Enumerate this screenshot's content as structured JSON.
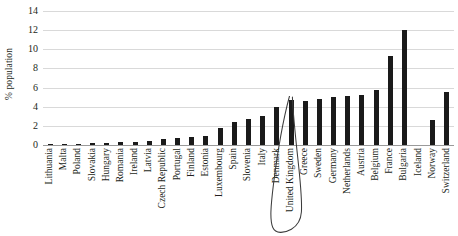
{
  "chart_data": {
    "type": "bar",
    "title": "",
    "xlabel": "",
    "ylabel": "% population",
    "ylim": [
      0,
      14
    ],
    "ytick_step": 2,
    "yticks": [
      14,
      12,
      10,
      8,
      6,
      4,
      2,
      0
    ],
    "grid": true,
    "legend": false,
    "bar_color": "#1a1a1a",
    "categories": [
      "Lithuania",
      "Malta",
      "Poland",
      "Slovakia",
      "Hungary",
      "Romania",
      "Ireland",
      "Latvia",
      "Czech Republic",
      "Portugal",
      "Finland",
      "Estonia",
      "Luxembourg",
      "Spain",
      "Slovenia",
      "Italy",
      "Denmark",
      "United Kingdom",
      "Greece",
      "Sweden",
      "Germany",
      "Netherlands",
      "Austria",
      "Belgium",
      "France",
      "Bulgaria",
      "Iceland",
      "Norway",
      "Switzerland"
    ],
    "values": [
      0.05,
      0.1,
      0.15,
      0.2,
      0.25,
      0.3,
      0.35,
      0.4,
      0.6,
      0.7,
      0.8,
      0.9,
      1.8,
      2.4,
      2.7,
      3.0,
      4.0,
      4.7,
      4.6,
      4.8,
      5.0,
      5.1,
      5.2,
      5.7,
      9.3,
      12.0,
      0,
      2.6,
      5.5
    ],
    "annotations": [
      {
        "type": "hand-drawn-loop",
        "target": "United Kingdom",
        "description": "hand-drawn oval circling the United Kingdom axis label"
      }
    ]
  }
}
